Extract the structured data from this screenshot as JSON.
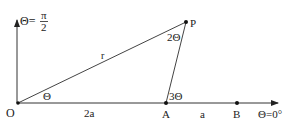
{
  "diagram": {
    "points": {
      "O": {
        "label": "O",
        "x": 18,
        "y": 103
      },
      "A": {
        "label": "A",
        "x": 166,
        "y": 103
      },
      "B": {
        "label": "B",
        "x": 237,
        "y": 103
      },
      "P": {
        "label": "P",
        "x": 186,
        "y": 22
      }
    },
    "labels": {
      "vertical_axis_theta": "Θ=",
      "vertical_axis_pi": "π",
      "vertical_axis_2": "2",
      "horizontal_axis": "Θ=0°",
      "segment_OP": "r",
      "segment_OA": "2a",
      "segment_AB": "a",
      "angle_O": "Θ",
      "angle_P": "2Θ",
      "angle_A": "3Θ"
    },
    "colors": {
      "line": "#333333",
      "text": "#222222",
      "background": "#ffffff"
    }
  }
}
